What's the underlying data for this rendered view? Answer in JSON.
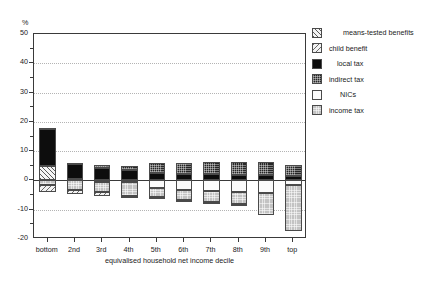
{
  "chart_data": {
    "type": "bar",
    "title": "",
    "xlabel": "equivalised household net income decile",
    "ylabel": "%",
    "ylim": [
      -20,
      50
    ],
    "yticks": [
      50,
      40,
      30,
      20,
      10,
      0,
      -10,
      -20
    ],
    "ytick_labels": [
      "50",
      "40",
      "30",
      "20",
      "10",
      "0",
      "-10",
      "-20"
    ],
    "grid": "horizontal dotted gridlines at each y tick; solid zero line",
    "stacked": true,
    "legend_position": "right",
    "categories": [
      "bottom",
      "2nd",
      "3rd",
      "4th",
      "5th",
      "6th",
      "7th",
      "8th",
      "9th",
      "top"
    ],
    "series": [
      {
        "name": "means-tested benefits",
        "key": "means",
        "sign": "positive",
        "values": [
          5.0,
          0.6,
          0.3,
          0.2,
          0.0,
          0.0,
          0.0,
          0.0,
          0.0,
          0.0
        ]
      },
      {
        "name": "child benefit",
        "key": "child",
        "sign": "negative",
        "values": [
          -2.2,
          -1.6,
          -1.3,
          -0.9,
          -0.7,
          -0.6,
          -0.5,
          -0.3,
          0.0,
          0.0
        ]
      },
      {
        "name": "local tax",
        "key": "local",
        "sign": "positive",
        "values": [
          12.4,
          5.0,
          3.8,
          3.2,
          2.6,
          2.3,
          2.1,
          1.9,
          1.7,
          1.4
        ]
      },
      {
        "name": "indirect tax",
        "key": "indirect",
        "sign": "positive",
        "values": [
          0.6,
          0.4,
          1.1,
          1.5,
          3.2,
          3.6,
          4.1,
          4.4,
          4.6,
          3.8
        ]
      },
      {
        "name": "NICs",
        "key": "nics",
        "sign": "negative",
        "values": [
          0.0,
          0.0,
          -0.4,
          -0.6,
          -2.6,
          -3.2,
          -3.6,
          -4.0,
          -4.2,
          -1.4
        ]
      },
      {
        "name": "income tax",
        "key": "income",
        "sign": "negative",
        "values": [
          -1.6,
          -3.2,
          -3.6,
          -4.6,
          -3.2,
          -3.4,
          -3.8,
          -4.2,
          -7.6,
          -15.8
        ]
      }
    ],
    "bar_totals_positive": [
      18.0,
      6.0,
      5.2,
      4.9,
      5.8,
      5.9,
      6.2,
      6.3,
      6.3,
      5.2
    ],
    "bar_totals_negative": [
      -3.8,
      -4.8,
      -5.3,
      -6.1,
      -6.5,
      -7.2,
      -7.9,
      -8.5,
      -11.8,
      -17.2
    ]
  },
  "axis": {
    "y_unit_label": "%",
    "x_title": "equivalised household net income decile"
  },
  "legend": {
    "items": [
      {
        "label": "means-tested benefits",
        "fill": "f-means",
        "icon": "pattern-diagonal-hatch-swatch"
      },
      {
        "label": "child benefit",
        "fill": "f-child",
        "icon": "pattern-back-hatch-swatch"
      },
      {
        "label": "local tax",
        "fill": "f-local",
        "icon": "solid-black-swatch"
      },
      {
        "label": "indirect tax",
        "fill": "f-indirect",
        "icon": "dark-checker-swatch"
      },
      {
        "label": "NICs",
        "fill": "f-nics",
        "icon": "white-swatch"
      },
      {
        "label": "income tax",
        "fill": "f-income",
        "icon": "light-grey-swatch"
      }
    ]
  },
  "colors": {
    "axis": "#3a3a3a",
    "grid": "#b4b4b4",
    "local_tax": "#0d0d0d",
    "indirect_tax": "#262626",
    "nics": "#fbfbfb",
    "income_tax": "#c3c3c3",
    "background": "#ffffff"
  }
}
